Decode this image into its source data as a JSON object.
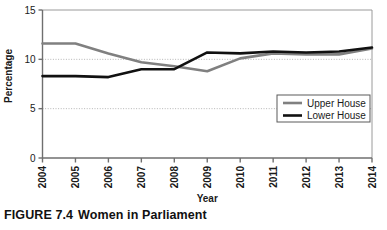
{
  "figure": {
    "caption_prefix": "FIGURE 7.4",
    "caption_title": "Women in Parliament"
  },
  "chart_data": {
    "type": "line",
    "title": "",
    "xlabel": "Year",
    "ylabel": "Percentage",
    "categories": [
      "2004",
      "2005",
      "2006",
      "2007",
      "2008",
      "2009",
      "2010",
      "2011",
      "2012",
      "2013",
      "2014"
    ],
    "x": [
      2004,
      2005,
      2006,
      2007,
      2008,
      2009,
      2010,
      2011,
      2012,
      2013,
      2014
    ],
    "series": [
      {
        "name": "Upper House",
        "color": "#808080",
        "values": [
          11.6,
          11.6,
          10.6,
          9.7,
          9.3,
          8.8,
          10.1,
          10.6,
          10.5,
          10.5,
          11.1
        ]
      },
      {
        "name": "Lower House",
        "color": "#111111",
        "values": [
          8.3,
          8.3,
          8.2,
          9.0,
          9.0,
          10.7,
          10.6,
          10.8,
          10.7,
          10.8,
          11.2
        ]
      }
    ],
    "ylim": [
      0,
      15
    ],
    "yticks": [
      0,
      5,
      10,
      15
    ],
    "ytick_labels": [
      "0",
      "5",
      "10",
      "15"
    ],
    "xlim": [
      2004,
      2014
    ],
    "grid": "horizontal-dotted",
    "legend_position": "bottom-right",
    "legend_entries": [
      "Upper House",
      "Lower House"
    ]
  }
}
